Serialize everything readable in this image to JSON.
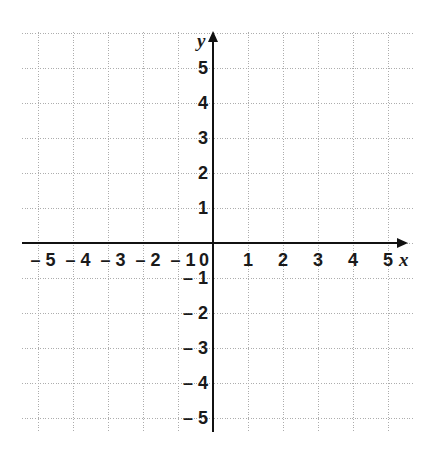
{
  "figure": {
    "kind": "coordinate-plane",
    "title": "",
    "background_color": "#ffffff",
    "grid_color": "#adadad",
    "axis_color": "#111111",
    "label_color": "#1a1a1a"
  },
  "chart_data": {
    "type": "scatter",
    "title": "",
    "xlabel": "x",
    "ylabel": "y",
    "xlim": [
      -5.5,
      5.5
    ],
    "ylim": [
      -5.5,
      5.5
    ],
    "grid": true,
    "grid_style": "dotted",
    "grid_step": 1,
    "legend": null,
    "series": [],
    "x": [],
    "y": [],
    "annotations": [],
    "x_ticks": [
      -5,
      -4,
      -3,
      -2,
      -1,
      0,
      1,
      2,
      3,
      4,
      5
    ],
    "y_ticks": [
      5,
      4,
      3,
      2,
      1,
      -1,
      -2,
      -3,
      -4,
      -5
    ],
    "x_tick_labels": [
      "– 5",
      "– 4",
      "– 3",
      "– 2",
      "– 1",
      "0",
      "1",
      "2",
      "3",
      "4",
      "5"
    ],
    "y_tick_labels": [
      "5",
      "4",
      "3",
      "2",
      "1",
      "– 1",
      "– 2",
      "– 3",
      "– 4",
      "– 5"
    ],
    "origin_label": "0",
    "x_axis_arrow": true,
    "y_axis_arrow": true
  },
  "axes": {
    "x_name": "x",
    "y_name": "y"
  },
  "ticks": {
    "x": [
      {
        "value": -5,
        "label": "– 5"
      },
      {
        "value": -4,
        "label": "– 4"
      },
      {
        "value": -3,
        "label": "– 3"
      },
      {
        "value": -2,
        "label": "– 2"
      },
      {
        "value": -1,
        "label": "– 1"
      },
      {
        "value": 0,
        "label": "0"
      },
      {
        "value": 1,
        "label": "1"
      },
      {
        "value": 2,
        "label": "2"
      },
      {
        "value": 3,
        "label": "3"
      },
      {
        "value": 4,
        "label": "4"
      },
      {
        "value": 5,
        "label": "5"
      }
    ],
    "y": [
      {
        "value": 5,
        "label": "5"
      },
      {
        "value": 4,
        "label": "4"
      },
      {
        "value": 3,
        "label": "3"
      },
      {
        "value": 2,
        "label": "2"
      },
      {
        "value": 1,
        "label": "1"
      },
      {
        "value": -1,
        "label": "– 1"
      },
      {
        "value": -2,
        "label": "– 2"
      },
      {
        "value": -3,
        "label": "– 3"
      },
      {
        "value": -4,
        "label": "– 4"
      },
      {
        "value": -5,
        "label": "– 5"
      }
    ]
  }
}
